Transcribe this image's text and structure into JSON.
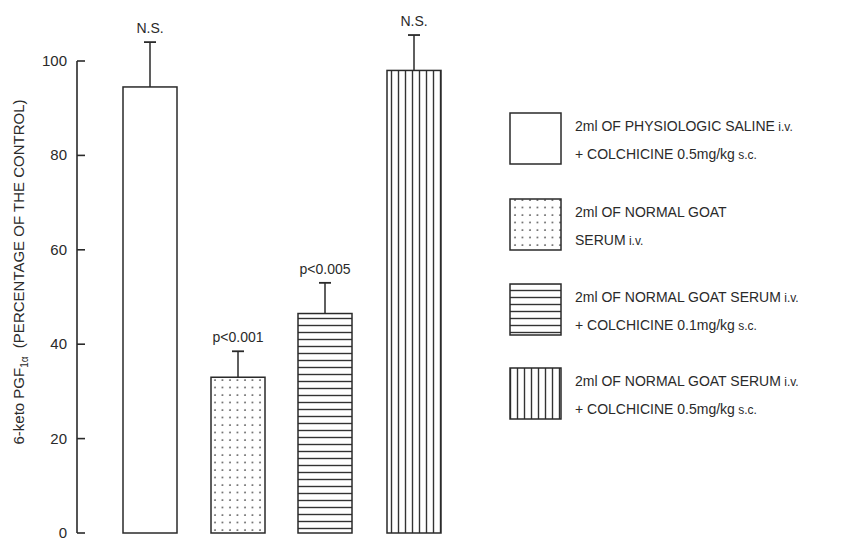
{
  "chart_data": {
    "type": "bar",
    "title": "",
    "xlabel": "",
    "ylabel": "6-keto PGF1α (PERCENTAGE OF THE CONTROL)",
    "ylabel_parts": {
      "main": "6-keto PGF",
      "sub": "1α",
      "rest": "  (PERCENTAGE OF THE CONTROL)"
    },
    "ylim": [
      0,
      100
    ],
    "yticks": [
      0,
      20,
      40,
      60,
      80,
      100
    ],
    "grid": false,
    "legend_position": "right",
    "categories": [
      "2ml OF PHYSIOLOGIC SALINE i.v. + COLCHICINE 0.5mg/kg s.c.",
      "2ml OF NORMAL GOAT SERUM i.v.",
      "2ml OF NORMAL GOAT SERUM i.v. + COLCHICINE 0.1mg/kg s.c.",
      "2ml OF NORMAL GOAT SERUM i.v. + COLCHICINE 0.5mg/kg s.c."
    ],
    "values": [
      94.5,
      33,
      46.5,
      98
    ],
    "error_upper": [
      104,
      38.5,
      53,
      105.5
    ],
    "patterns": [
      "none",
      "dots",
      "horizontal-lines",
      "vertical-lines"
    ],
    "annotations": [
      "N.S.",
      "p<0.001",
      "p<0.005",
      "N.S."
    ]
  },
  "legend": [
    {
      "line1": "2ml OF PHYSIOLOGIC SALINE",
      "line1_small": " i.v.",
      "line2": "+ COLCHICINE 0.5mg/kg",
      "line2_small": " s.c.",
      "pattern": "none"
    },
    {
      "line1": "2ml OF NORMAL GOAT",
      "line1_small": "",
      "line2": "SERUM",
      "line2_small": " i.v.",
      "pattern": "dots"
    },
    {
      "line1": "2ml OF NORMAL GOAT SERUM",
      "line1_small": " i.v.",
      "line2": "+ COLCHICINE 0.1mg/kg",
      "line2_small": " s.c.",
      "pattern": "horizontal-lines"
    },
    {
      "line1": "2ml OF NORMAL GOAT SERUM",
      "line1_small": " i.v.",
      "line2": "+ COLCHICINE 0.5mg/kg",
      "line2_small": " s.c.",
      "pattern": "vertical-lines"
    }
  ],
  "colors": {
    "ink": "#2a2a2a",
    "background": "#ffffff"
  }
}
